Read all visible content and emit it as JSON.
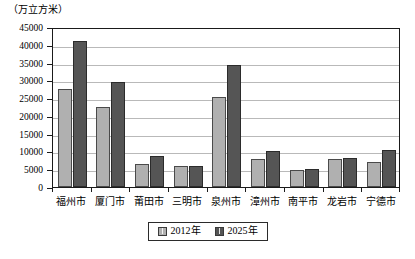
{
  "chart_data": {
    "type": "bar",
    "title": "",
    "subtitle": "",
    "unit_caption": "（万立方米）",
    "xlabel": "",
    "ylabel": "",
    "ylim": [
      0,
      45000
    ],
    "ytick_step": 5000,
    "ytick_labels": [
      "45000",
      "40000",
      "35000",
      "30000",
      "25000",
      "20000",
      "15000",
      "10000",
      "5000",
      "0"
    ],
    "ytick_values": [
      45000,
      40000,
      35000,
      30000,
      25000,
      20000,
      15000,
      10000,
      5000,
      0
    ],
    "grid": true,
    "legend_position": "bottom-center",
    "categories": [
      "福州市",
      "厦门市",
      "莆田市",
      "三明市",
      "泉州市",
      "漳州市",
      "南平市",
      "龙岩市",
      "宁德市"
    ],
    "series": [
      {
        "name": "2012年",
        "color": "#b0b0b0",
        "values": [
          27600,
          22400,
          6400,
          6000,
          25400,
          7900,
          4700,
          7800,
          7000
        ]
      },
      {
        "name": "2025年",
        "color": "#555555",
        "values": [
          41200,
          29500,
          8800,
          6000,
          34200,
          10200,
          5000,
          8100,
          10400
        ]
      }
    ],
    "legend": [
      {
        "label": "2012年",
        "swatch": "legend-swatch-2012"
      },
      {
        "label": "2025年",
        "swatch": "legend-swatch-2025"
      }
    ]
  }
}
